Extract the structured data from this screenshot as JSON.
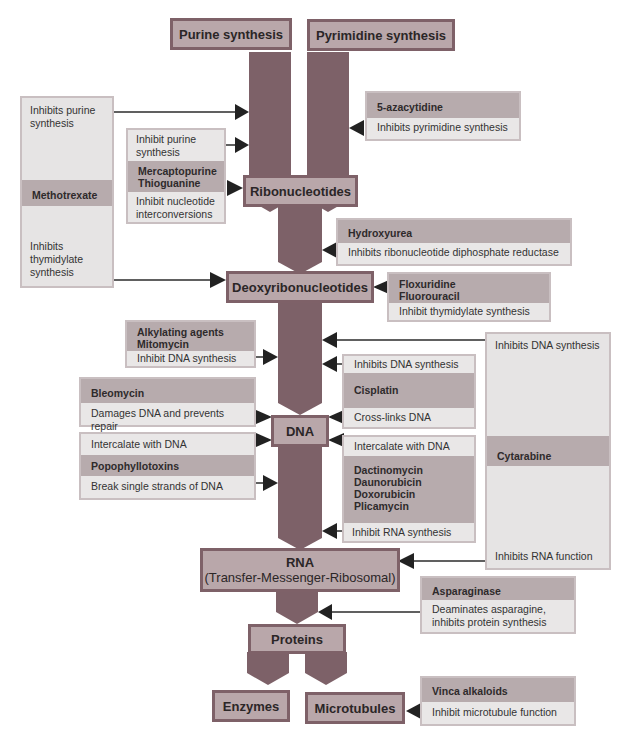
{
  "nodes": {
    "purine": "Purine synthesis",
    "pyrimidine": "Pyrimidine synthesis",
    "ribo": "Ribonucleotides",
    "deoxy": "Deoxyribonucleotides",
    "dna": "DNA",
    "rna": "RNA",
    "rna_sub": "(Transfer-Messenger-Ribosomal)",
    "proteins": "Proteins",
    "enzymes": "Enzymes",
    "microtubules": "Microtubules"
  },
  "drugs": {
    "methotrexate": {
      "name": "Methotrexate",
      "effect1": "Inhibits purine synthesis",
      "effect2": "Inhibits thymidylate synthesis"
    },
    "mercaptopurine": {
      "name_line1": "Mercaptopurine",
      "name_line2": "Thioguanine",
      "effect1": "Inhibit purine synthesis",
      "effect2": "Inhibit nucleotide interconversions"
    },
    "azacytidine": {
      "name": "5-azacytidine",
      "effect": "Inhibits pyrimidine synthesis"
    },
    "hydroxyurea": {
      "name": "Hydroxyurea",
      "effect": "Inhibits ribonucleotide diphosphate reductase"
    },
    "floxuridine": {
      "name_line1": "Floxuridine",
      "name_line2": "Fluorouracil",
      "effect": "Inhibit thymidylate synthesis"
    },
    "alkylating": {
      "name_line1": "Alkylating agents",
      "name_line2": "Mitomycin",
      "effect": "Inhibit DNA synthesis"
    },
    "bleomycin": {
      "name": "Bleomycin",
      "effect": "Damages DNA and prevents repair"
    },
    "popophyllotoxins": {
      "name": "Popophyllotoxins",
      "effect1": "Intercalate with DNA",
      "effect2": "Break single strands of DNA"
    },
    "cisplatin": {
      "name": "Cisplatin",
      "effect1": "Inhibits DNA synthesis",
      "effect2": "Cross-links DNA"
    },
    "dactinomycin": {
      "names": [
        "Dactinomycin",
        "Daunorubicin",
        "Doxorubicin",
        "Plicamycin"
      ],
      "effect1": "Intercalate with DNA",
      "effect2": "Inhibit RNA synthesis"
    },
    "cytarabine": {
      "name": "Cytarabine",
      "effect1": "Inhibits DNA synthesis",
      "effect2": "Inhibits RNA function"
    },
    "asparaginase": {
      "name": "Asparaginase",
      "effect": "Deaminates asparagine, inhibits protein synthesis"
    },
    "vinca": {
      "name": "Vinca alkaloids",
      "effect": "Inhibit microtubule function"
    }
  },
  "colors": {
    "node_fill": "#b9a7aa",
    "node_border": "#7e6168",
    "column": "#7d6168",
    "panel": "#b7abad",
    "band": "#e9e7e7",
    "arrow": "#222222"
  }
}
